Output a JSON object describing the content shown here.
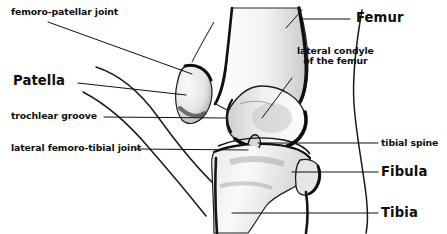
{
  "figure": {
    "background_color": "#ffffff",
    "ink_color": "#0d0d0d",
    "width": 447,
    "height": 234
  },
  "labels": {
    "femoro_patellar_joint": "femoro-patellar joint",
    "patella": "Patella",
    "trochlear_groove": "trochlear groove",
    "lateral_femoro_tibial_joint": "lateral femoro-tibial joint",
    "femur": "Femur",
    "lateral_condyle_line1": "lateral condyle",
    "lateral_condyle_line2": "of the femur",
    "tibial_spine": "tibial spine",
    "fibula": "Fibula",
    "tibia": "Tibia"
  },
  "anatomy": {
    "bones": [
      "femur",
      "patella",
      "tibia",
      "fibula"
    ],
    "soft_tissue_outline": [
      "anterior skin contour",
      "posterior skin contour"
    ]
  }
}
